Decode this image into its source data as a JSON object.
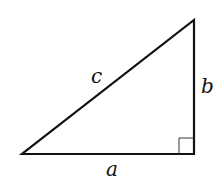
{
  "diagram": {
    "type": "right-triangle",
    "colors": {
      "stroke": "#111111",
      "background": "#ffffff"
    },
    "labels": {
      "hypotenuse": "c",
      "vertical_leg": "b",
      "horizontal_leg": "a"
    },
    "right_angle_marker": true
  }
}
